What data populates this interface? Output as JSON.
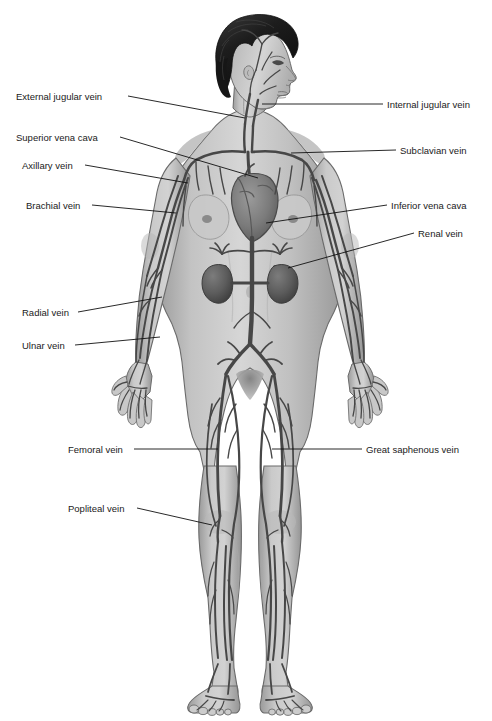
{
  "figure": {
    "colors": {
      "background": "#ffffff",
      "skin_light": "#d2d2d2",
      "skin_mid": "#bcbcbc",
      "skin_shadow": "#9a9a9a",
      "outline": "#5a5a5a",
      "vein": "#4a4a4a",
      "vein_dark": "#3a3a3a",
      "organ_dark": "#6a6a6a",
      "heart": "#787878",
      "kidney": "#5e5e5e",
      "hair": "#1a1a1a",
      "leader_line": "#111111",
      "label_text": "#1a1a1a"
    }
  },
  "labels": {
    "left": [
      {
        "text": "External jugular vein",
        "text_x": 16,
        "text_y": 91,
        "line_from_x": 128,
        "line_from_y": 96,
        "line_to_x": 245,
        "line_to_y": 118
      },
      {
        "text": "Superior vena cava",
        "text_x": 16,
        "text_y": 132,
        "line_from_x": 120,
        "line_from_y": 137,
        "line_to_x": 258,
        "line_to_y": 178
      },
      {
        "text": "Axillary vein",
        "text_x": 22,
        "text_y": 160,
        "line_from_x": 85,
        "line_from_y": 165,
        "line_to_x": 188,
        "line_to_y": 183
      },
      {
        "text": "Brachial vein",
        "text_x": 26,
        "text_y": 200,
        "line_from_x": 92,
        "line_from_y": 205,
        "line_to_x": 176,
        "line_to_y": 213
      },
      {
        "text": "Radial vein",
        "text_x": 22,
        "text_y": 307,
        "line_from_x": 78,
        "line_from_y": 312,
        "line_to_x": 162,
        "line_to_y": 297
      },
      {
        "text": "Ulnar vein",
        "text_x": 22,
        "text_y": 340,
        "line_from_x": 75,
        "line_from_y": 345,
        "line_to_x": 160,
        "line_to_y": 337
      },
      {
        "text": "Femoral vein",
        "text_x": 68,
        "text_y": 444,
        "line_from_x": 134,
        "line_from_y": 449,
        "line_to_x": 218,
        "line_to_y": 449
      },
      {
        "text": "Popliteal vein",
        "text_x": 68,
        "text_y": 503,
        "line_from_x": 137,
        "line_from_y": 508,
        "line_to_x": 212,
        "line_to_y": 525
      }
    ],
    "right": [
      {
        "text": "Internal jugular vein",
        "text_x": 387,
        "text_y": 99,
        "line_from_x": 383,
        "line_from_y": 104,
        "line_to_x": 262,
        "line_to_y": 104
      },
      {
        "text": "Subclavian vein",
        "text_x": 400,
        "text_y": 145,
        "line_from_x": 396,
        "line_from_y": 150,
        "line_to_x": 291,
        "line_to_y": 153
      },
      {
        "text": "Inferior vena cava",
        "text_x": 391,
        "text_y": 200,
        "line_from_x": 387,
        "line_from_y": 205,
        "line_to_x": 266,
        "line_to_y": 223
      },
      {
        "text": "Renal vein",
        "text_x": 418,
        "text_y": 228,
        "line_from_x": 414,
        "line_from_y": 233,
        "line_to_x": 288,
        "line_to_y": 268
      },
      {
        "text": "Great saphenous vein",
        "text_x": 366,
        "text_y": 444,
        "line_from_x": 362,
        "line_from_y": 449,
        "line_to_x": 272,
        "line_to_y": 449
      }
    ]
  },
  "anatomy_parts": [
    "head",
    "hair",
    "face-profile",
    "neck",
    "torso",
    "breasts",
    "heart",
    "kidney-left",
    "kidney-right",
    "arms",
    "hands",
    "legs",
    "feet"
  ]
}
